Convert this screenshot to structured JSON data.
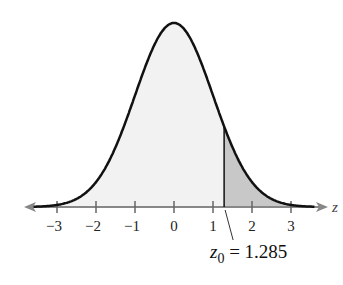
{
  "chart_data": {
    "type": "area",
    "title": "",
    "xlabel": "z",
    "ylabel": "",
    "xlim": [
      -3.5,
      3.5
    ],
    "ticks": [
      -3,
      -2,
      -1,
      0,
      1,
      2,
      3
    ],
    "tick_labels": [
      "−3",
      "−2",
      "−1",
      "0",
      "1",
      "2",
      "3"
    ],
    "grid": false,
    "legend": null,
    "shaded_region": {
      "from": 1.285,
      "to": 3.5,
      "color": "#c8c8c8"
    },
    "unshaded_fill": "#f2f2f2",
    "annotation": {
      "label_var": "z",
      "label_sub": "0",
      "label_rest": " = 1.285",
      "value": 1.285
    }
  },
  "axis": {
    "label": "z"
  }
}
